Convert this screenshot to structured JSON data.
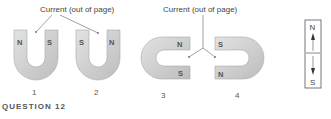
{
  "figure": {
    "caption_left": "Current (out of page)",
    "caption_right": "Current (out of page)",
    "question_label": "QUESTION 12",
    "magnets": [
      {
        "number": "1",
        "left_pole": "N",
        "right_pole": "S",
        "orientation": "U opening up"
      },
      {
        "number": "2",
        "left_pole": "S",
        "right_pole": "N",
        "orientation": "U opening up"
      },
      {
        "number": "3",
        "top_pole": "N",
        "bottom_pole": "S",
        "orientation": "U opening right"
      },
      {
        "number": "4",
        "top_pole": "S",
        "bottom_pole": "N",
        "orientation": "U opening left"
      }
    ],
    "compass": {
      "north": "N",
      "south": "S"
    }
  }
}
